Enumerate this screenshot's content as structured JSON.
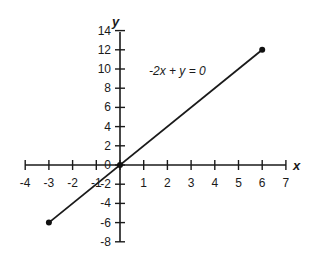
{
  "chart_data": {
    "type": "line",
    "title": "",
    "annotation": "-2x + y = 0",
    "xlabel": "x",
    "ylabel": "y",
    "xlim": [
      -4,
      7
    ],
    "ylim": [
      -8,
      14
    ],
    "x_ticks": [
      -4,
      -3,
      -2,
      -1,
      0,
      1,
      2,
      3,
      4,
      5,
      6,
      7
    ],
    "y_ticks": [
      -8,
      -6,
      -4,
      -2,
      0,
      2,
      4,
      6,
      8,
      10,
      12,
      14
    ],
    "grid": false,
    "legend": null,
    "series": [
      {
        "name": "-2x + y = 0",
        "points": [
          [
            -3,
            -6
          ],
          [
            0,
            0
          ],
          [
            6,
            12
          ]
        ],
        "endpoints_marked": true,
        "origin_marked": true
      }
    ]
  },
  "labels": {
    "x_axis_name": "x",
    "y_axis_name": "y",
    "equation": "-2x + y = 0",
    "x_tick_labels": [
      "-4",
      "-3",
      "-2",
      "-1",
      "1",
      "2",
      "3",
      "4",
      "5",
      "6",
      "7"
    ],
    "y_tick_labels": [
      "14",
      "12",
      "10",
      "8",
      "6",
      "4",
      "2",
      "0",
      "-2",
      "-4",
      "-6",
      "-8"
    ]
  }
}
